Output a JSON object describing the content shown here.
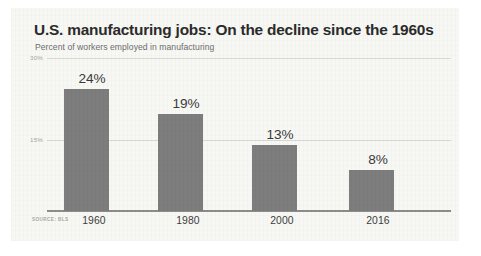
{
  "card": {
    "background_color": "#f7f7f4"
  },
  "header": {
    "title": "U.S. manufacturing jobs: On the decline since the 1960s",
    "subtitle": "Percent of workers employed in manufacturing"
  },
  "source": {
    "text": "SOURCE: BLS"
  },
  "chart_data": {
    "type": "bar",
    "title": "U.S. manufacturing jobs: On the decline since the 1960s",
    "subtitle": "Percent of workers employed in manufacturing",
    "xlabel": "",
    "ylabel": "",
    "categories": [
      "1960",
      "1980",
      "2000",
      "2016"
    ],
    "values": [
      24,
      19,
      13,
      8
    ],
    "value_labels": [
      "24%",
      "19%",
      "13%",
      "8%"
    ],
    "ylim": [
      0,
      30
    ],
    "yticks": [
      15,
      30
    ],
    "ytick_labels": [
      "15%",
      "30%"
    ],
    "grid": true,
    "legend": false,
    "bar_color": "#7d7d7d",
    "gridline_color": "#d9d9d6",
    "axis_color": "#8c8c88",
    "source": "SOURCE: BLS"
  }
}
